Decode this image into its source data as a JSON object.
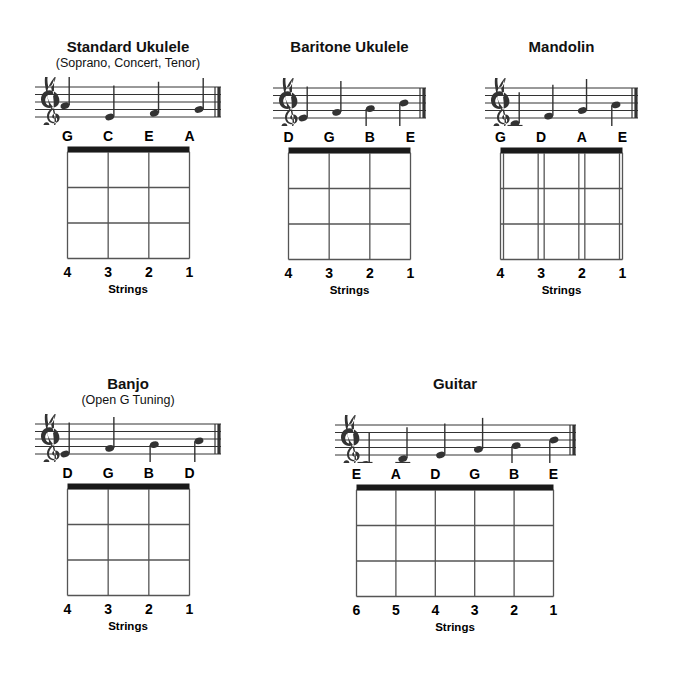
{
  "page": {
    "width": 678,
    "height": 673,
    "background": "#ffffff",
    "nut_color": "#1a1a1a",
    "grid_color": "#555555",
    "staff_color": "#333333",
    "text_color": "#000000",
    "strings_caption": "Strings"
  },
  "instruments": [
    {
      "id": "standard-ukulele",
      "title": "Standard Ukulele",
      "subtitle": "(Soprano, Concert, Tenor)",
      "x": 33,
      "y": 38,
      "staff": {
        "width": 190,
        "height": 48,
        "clef": "treble-clef",
        "notes": [
          {
            "name": "G",
            "staff_step": 3,
            "stem": "up",
            "ledger": 0
          },
          {
            "name": "C",
            "staff_step": 0,
            "stem": "up",
            "ledger": 0
          },
          {
            "name": "E",
            "staff_step": 1,
            "stem": "up",
            "ledger": 0
          },
          {
            "name": "A",
            "staff_step": 2,
            "stem": "up",
            "ledger": 0
          }
        ]
      },
      "note_labels": [
        "G",
        "C",
        "E",
        "A"
      ],
      "fretboard": {
        "strings": 4,
        "frets": 3,
        "doubled": false,
        "width": 125,
        "height": 115,
        "string_numbers": [
          "4",
          "3",
          "2",
          "1"
        ]
      }
    },
    {
      "id": "baritone-ukulele",
      "title": "Baritone Ukulele",
      "subtitle": "",
      "x": 262,
      "y": 38,
      "staff": {
        "width": 157,
        "height": 48,
        "clef": "treble-clef",
        "notes": [
          {
            "name": "D",
            "staff_step": 0,
            "stem": "up",
            "ledger": 0
          },
          {
            "name": "G",
            "staff_step": 1.5,
            "stem": "up",
            "ledger": 0
          },
          {
            "name": "B",
            "staff_step": 2.5,
            "stem": "down",
            "ledger": 0
          },
          {
            "name": "E",
            "staff_step": 4,
            "stem": "down",
            "ledger": 0
          }
        ]
      },
      "note_labels": [
        "D",
        "G",
        "B",
        "E"
      ],
      "fretboard": {
        "strings": 4,
        "frets": 3,
        "doubled": false,
        "width": 125,
        "height": 115,
        "string_numbers": [
          "4",
          "3",
          "2",
          "1"
        ]
      }
    },
    {
      "id": "mandolin",
      "title": "Mandolin",
      "subtitle": "",
      "x": 474,
      "y": 38,
      "staff": {
        "width": 157,
        "height": 48,
        "clef": "treble-clef",
        "notes": [
          {
            "name": "G",
            "staff_step": -1.5,
            "stem": "up",
            "ledger": 1
          },
          {
            "name": "D",
            "staff_step": 0.5,
            "stem": "up",
            "ledger": 0
          },
          {
            "name": "A",
            "staff_step": 2,
            "stem": "up",
            "ledger": 0
          },
          {
            "name": "E",
            "staff_step": 3.5,
            "stem": "down",
            "ledger": 0
          }
        ]
      },
      "note_labels": [
        "G",
        "D",
        "A",
        "E"
      ],
      "fretboard": {
        "strings": 4,
        "frets": 3,
        "doubled": true,
        "width": 125,
        "height": 115,
        "string_numbers": [
          "4",
          "3",
          "2",
          "1"
        ]
      }
    },
    {
      "id": "banjo",
      "title": "Banjo",
      "subtitle": "(Open G Tuning)",
      "x": 33,
      "y": 375,
      "staff": {
        "width": 190,
        "height": 48,
        "clef": "treble-clef",
        "notes": [
          {
            "name": "D",
            "staff_step": 0,
            "stem": "up",
            "ledger": 0
          },
          {
            "name": "G",
            "staff_step": 1.5,
            "stem": "up",
            "ledger": 0
          },
          {
            "name": "B",
            "staff_step": 2.5,
            "stem": "down",
            "ledger": 0
          },
          {
            "name": "D",
            "staff_step": 3.5,
            "stem": "down",
            "ledger": 0
          }
        ]
      },
      "note_labels": [
        "D",
        "G",
        "B",
        "D"
      ],
      "fretboard": {
        "strings": 4,
        "frets": 3,
        "doubled": false,
        "width": 125,
        "height": 115,
        "string_numbers": [
          "4",
          "3",
          "2",
          "1"
        ]
      }
    },
    {
      "id": "guitar",
      "title": "Guitar",
      "subtitle": "",
      "x": 330,
      "y": 375,
      "staff": {
        "width": 245,
        "height": 48,
        "clef": "treble-clef",
        "notes": [
          {
            "name": "E",
            "staff_step": -2.5,
            "stem": "up",
            "ledger": 2
          },
          {
            "name": "A",
            "staff_step": -1,
            "stem": "up",
            "ledger": 1
          },
          {
            "name": "D",
            "staff_step": 0,
            "stem": "up",
            "ledger": 0
          },
          {
            "name": "G",
            "staff_step": 1.5,
            "stem": "up",
            "ledger": 0
          },
          {
            "name": "B",
            "staff_step": 2.5,
            "stem": "down",
            "ledger": 0
          },
          {
            "name": "E",
            "staff_step": 4,
            "stem": "down",
            "ledger": 0
          }
        ]
      },
      "note_labels": [
        "E",
        "A",
        "D",
        "G",
        "B",
        "E"
      ],
      "fretboard": {
        "strings": 6,
        "frets": 3,
        "doubled": false,
        "width": 200,
        "height": 115,
        "string_numbers": [
          "6",
          "5",
          "4",
          "3",
          "2",
          "1"
        ]
      }
    }
  ]
}
